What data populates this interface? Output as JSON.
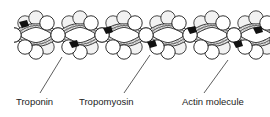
{
  "diagram": {
    "colors": {
      "stroke": "#1a1a1a",
      "bead_fill": "#ffffff",
      "strand_fill": "#d8d8d8",
      "troponin_fill": "#111111",
      "text": "#222222"
    },
    "labels": [
      {
        "id": "troponin",
        "text": "Troponin",
        "x": 16,
        "y": 97
      },
      {
        "id": "tropomyosin",
        "text": "Tropomyosin",
        "x": 79,
        "y": 97
      },
      {
        "id": "actin",
        "text": "Actin molecule",
        "x": 182,
        "y": 97
      }
    ],
    "leaders": [
      {
        "id": "troponin",
        "x1": 40,
        "y1": 93,
        "x2": 62,
        "y2": 57
      },
      {
        "id": "tropomyosin",
        "x1": 124,
        "y1": 93,
        "x2": 150,
        "y2": 55
      },
      {
        "id": "actin",
        "x1": 204,
        "y1": 93,
        "x2": 228,
        "y2": 60
      }
    ]
  }
}
